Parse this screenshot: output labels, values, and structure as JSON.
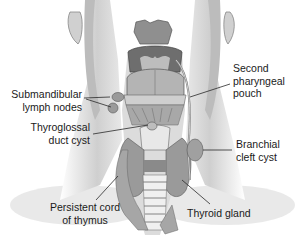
{
  "figure": {
    "labels": {
      "submandibular": {
        "line1": "Submandibular",
        "line2": "lymph nodes"
      },
      "thyroglossal": {
        "line1": "Thyroglossal",
        "line2": "duct cyst"
      },
      "second_pouch": {
        "line1": "Second",
        "line2": "pharyngeal",
        "line3": "pouch"
      },
      "branchial": {
        "line1": "Branchial",
        "line2": "cleft cyst"
      },
      "thymus": {
        "line1": "Persistent cord",
        "line2": "of thymus"
      },
      "thyroid": {
        "line1": "Thyroid gland"
      }
    },
    "colors": {
      "skin": "#e6e6e6",
      "skin_shadow": "#bdbdbd",
      "tissue": "#9a9a9a",
      "dark_tissue": "#7a7a7a",
      "cartilage": "#f2f2f2",
      "line": "#2a2a2a"
    }
  }
}
